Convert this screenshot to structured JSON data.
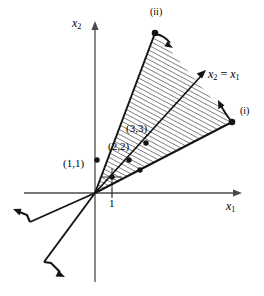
{
  "figure": {
    "kind": "diagram",
    "background_color": "#ffffff",
    "line_color": "#1a1a1a",
    "hatch_color": "#2b2b2b"
  },
  "axes": {
    "x_axis": {
      "name": "x1-axis",
      "label_base": "x",
      "label_sub": "1",
      "origin_px": [
        95,
        193
      ],
      "end_px": [
        240,
        193
      ],
      "arrow": true
    },
    "y_axis": {
      "name": "x2-axis",
      "label_base": "x",
      "label_sub": "2",
      "origin_px": [
        95,
        193
      ],
      "end_px": [
        95,
        22
      ],
      "arrow": true
    },
    "ticks": [
      {
        "name": "x1-tick-one",
        "label": "1",
        "axis": "x1",
        "px": [
          112,
          193
        ]
      }
    ]
  },
  "cone": {
    "apex_px": [
      95,
      193
    ],
    "hatched": true,
    "hatch_angle_deg": 62,
    "hatch_spacing_px": 4,
    "edges": [
      {
        "name": "cone-edge-ii",
        "marker_label": "(ii)",
        "generator_tip_px": [
          155,
          33
        ],
        "arrow_label": "(ii)"
      },
      {
        "name": "cone-edge-i",
        "marker_label": "(i)",
        "generator_tip_px": [
          232,
          122
        ],
        "arrow_label": "(i)"
      }
    ]
  },
  "diagonal_line": {
    "name": "x2-equals-x1-line",
    "label": "x",
    "label_sub": "2",
    "label_rest": " = x",
    "label_rest_sub": "1",
    "equation": "x2 = x1",
    "tip_px": [
      205,
      72
    ],
    "points": [
      {
        "name": "point-1-1",
        "label": "(1,1)",
        "px": [
          112,
          177
        ]
      },
      {
        "name": "point-2-2",
        "label": "(2,2)",
        "px": [
          129,
          160
        ]
      },
      {
        "name": "point-3-3",
        "label": "(3,3)",
        "px": [
          146,
          143
        ]
      }
    ]
  },
  "negative_rays": [
    {
      "name": "negative-ray-i",
      "from_px": [
        95,
        193
      ],
      "to_px": [
        22,
        223
      ]
    },
    {
      "name": "negative-ray-ii",
      "from_px": [
        95,
        193
      ],
      "to_px": [
        48,
        268
      ]
    }
  ],
  "labels": {
    "x1_axis": "x₁",
    "x2_axis": "x₂",
    "roman_one": "(i)",
    "roman_two": "(ii)",
    "tick_one": "1",
    "point_11": "(1,1)",
    "point_22": "(2,2)",
    "point_33": "(3,3)",
    "diagonal_equation": "x₂ = x₁"
  }
}
